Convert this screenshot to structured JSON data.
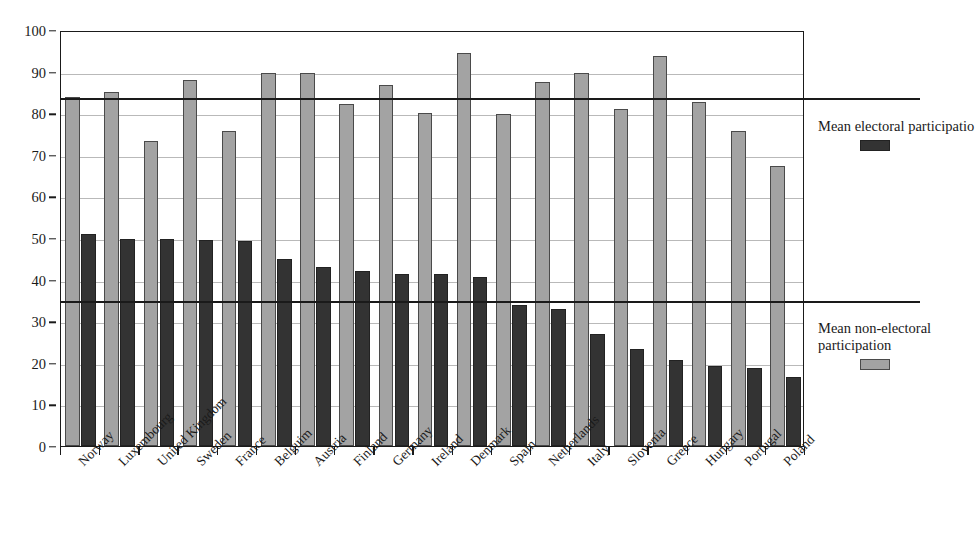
{
  "chart_data": {
    "type": "bar",
    "title": "",
    "subtitle": "",
    "xlabel": "",
    "ylabel": "",
    "ylim": [
      0,
      100
    ],
    "ytick_step": 10,
    "yticks": [
      0,
      10,
      20,
      30,
      40,
      50,
      60,
      70,
      80,
      90,
      100
    ],
    "grid": true,
    "legend_position": "right",
    "categories": [
      "Norway",
      "Luxembourg",
      "United Kingdom",
      "Sweden",
      "France",
      "Belguim",
      "Austria",
      "Finland",
      "Germany",
      "Ireland",
      "Denmark",
      "Spain",
      "Netherlands",
      "Italy",
      "Slovenia",
      "Greece",
      "Hungary",
      "Portugal",
      "Poland"
    ],
    "series": [
      {
        "name": "Mean non-electoral participation",
        "color": "#a3a3a3",
        "values": [
          84.0,
          85.2,
          73.4,
          88.0,
          75.7,
          89.7,
          89.6,
          82.3,
          86.8,
          80.1,
          94.5,
          79.9,
          87.5,
          89.6,
          81.0,
          93.8,
          82.7,
          75.7,
          67.3
        ]
      },
      {
        "name": "Mean electoral participation",
        "color": "#333333",
        "values": [
          51.0,
          49.8,
          49.8,
          49.6,
          49.3,
          45.0,
          43.0,
          42.1,
          41.3,
          41.3,
          40.6,
          33.8,
          32.9,
          27.0,
          23.4,
          20.6,
          19.3,
          18.7,
          16.7
        ]
      }
    ],
    "reference_lines": [
      {
        "name": "mean-non-electoral-reference",
        "value": 84.0
      },
      {
        "name": "mean-electoral-reference",
        "value": 35.0
      }
    ]
  },
  "legend": {
    "electoral": {
      "label": "Mean electoral participatio",
      "swatch_color": "#333333"
    },
    "non_electoral": {
      "label": "Mean non-electoral\nparticipation",
      "swatch_color": "#a3a3a3"
    }
  }
}
